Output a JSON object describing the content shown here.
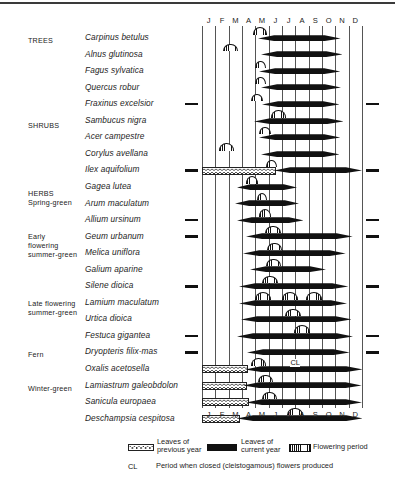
{
  "figure": {
    "months": [
      "J",
      "F",
      "M",
      "A",
      "M",
      "J",
      "J",
      "A",
      "S",
      "O",
      "N",
      "D"
    ]
  },
  "groups": [
    {
      "name": "group-trees",
      "lines": [
        "TREES"
      ],
      "top": 36
    },
    {
      "name": "group-shrubs",
      "lines": [
        "SHRUBS"
      ],
      "top": 121
    },
    {
      "name": "group-herbs-spring",
      "lines": [
        "HERBS",
        "Spring-green"
      ],
      "top": 189
    },
    {
      "name": "group-early-flowering",
      "lines": [
        "Early",
        "flowering",
        "summer-green"
      ],
      "top": 232
    },
    {
      "name": "group-late-flowering",
      "lines": [
        "Late flowering",
        "summer-green"
      ],
      "top": 299
    },
    {
      "name": "group-fern",
      "lines": [
        "Fern"
      ],
      "top": 350
    },
    {
      "name": "group-winter-green",
      "lines": [
        "Winter-green"
      ],
      "top": 384
    }
  ],
  "legend": {
    "previous_year": "Leaves of\nprevious year",
    "current_year": "Leaves of\ncurrent year",
    "flowering": "Flowering period",
    "cl_abbr": "CL",
    "cl_text": "Period when closed (cleistogamous) flowers produced"
  },
  "chart_data": {
    "type": "bar",
    "title": "",
    "xlabel": "",
    "ylabel": "",
    "categories": [
      "J",
      "F",
      "M",
      "A",
      "M",
      "J",
      "J",
      "A",
      "S",
      "O",
      "N",
      "D"
    ],
    "xlim": [
      0,
      12
    ],
    "grid": true,
    "legend_position": "bottom",
    "rows": [
      {
        "species": "Carpinus betulus",
        "group": "TREES",
        "leaves_current": [
          4.2,
          10.4
        ],
        "leaves_previous": null,
        "flowering": [
          [
            3.8,
            4.9
          ]
        ],
        "cl": null,
        "ticks": false
      },
      {
        "species": "Alnus glutinosa",
        "group": "TREES",
        "leaves_current": [
          4.4,
          10.5
        ],
        "leaves_previous": null,
        "flowering": [
          [
            1.6,
            2.7
          ]
        ],
        "cl": null,
        "ticks": false
      },
      {
        "species": "Fagus sylvatica",
        "group": "TREES",
        "leaves_current": [
          4.3,
          10.4
        ],
        "leaves_previous": null,
        "flowering": [
          [
            4.0,
            4.8
          ]
        ],
        "cl": null,
        "ticks": false
      },
      {
        "species": "Quercus robur",
        "group": "TREES",
        "leaves_current": [
          4.4,
          10.4
        ],
        "leaves_previous": null,
        "flowering": [
          [
            4.0,
            4.8
          ]
        ],
        "cl": null,
        "ticks": false
      },
      {
        "species": "Fraxinus excelsior",
        "group": "TREES",
        "leaves_current": [
          4.5,
          10.3
        ],
        "leaves_previous": null,
        "flowering": [
          [
            3.7,
            4.6
          ]
        ],
        "cl": null,
        "ticks": true
      },
      {
        "species": "Sambucus nigra",
        "group": "SHRUBS",
        "leaves_current": [
          3.9,
          10.6
        ],
        "leaves_previous": null,
        "flowering": [
          [
            5.2,
            6.3
          ]
        ],
        "cl": null,
        "ticks": false
      },
      {
        "species": "Acer campestre",
        "group": "SHRUBS",
        "leaves_current": [
          4.3,
          10.4
        ],
        "leaves_previous": null,
        "flowering": [
          [
            4.3,
            5.2
          ]
        ],
        "cl": null,
        "ticks": false
      },
      {
        "species": "Corylus avellana",
        "group": "SHRUBS",
        "leaves_current": [
          4.4,
          10.3
        ],
        "leaves_previous": null,
        "flowering": [
          [
            1.3,
            2.4
          ]
        ],
        "cl": null,
        "ticks": false
      },
      {
        "species": "Ilex aquifolium",
        "group": "SHRUBS",
        "leaves_current": [
          5.4,
          12.0
        ],
        "leaves_previous": [
          0.0,
          5.4
        ],
        "flowering": [
          [
            4.8,
            5.6
          ]
        ],
        "cl": null,
        "ticks": true
      },
      {
        "species": "Gagea lutea",
        "group": "HERBS Spring-green",
        "leaves_current": [
          2.6,
          7.1
        ],
        "leaves_previous": null,
        "flowering": [
          [
            3.3,
            4.2
          ]
        ],
        "cl": null,
        "ticks": false
      },
      {
        "species": "Arum maculatum",
        "group": "HERBS Spring-green",
        "leaves_current": [
          2.5,
          7.3
        ],
        "leaves_previous": null,
        "flowering": [
          [
            4.1,
            4.9
          ]
        ],
        "cl": null,
        "ticks": false
      },
      {
        "species": "Allium ursinum",
        "group": "HERBS Spring-green",
        "leaves_current": [
          2.6,
          7.6
        ],
        "leaves_previous": null,
        "flowering": [
          [
            4.3,
            5.2
          ]
        ],
        "cl": null,
        "ticks": true
      },
      {
        "species": "Geum urbanum",
        "group": "Early flowering summer-green",
        "leaves_current": [
          3.3,
          11.3
        ],
        "leaves_previous": null,
        "flowering": [
          [
            4.7,
            5.9
          ]
        ],
        "cl": null,
        "ticks": true
      },
      {
        "species": "Melica uniflora",
        "group": "Early flowering summer-green",
        "leaves_current": [
          3.1,
          10.8
        ],
        "leaves_previous": null,
        "flowering": [
          [
            4.9,
            6.0
          ]
        ],
        "cl": null,
        "ticks": false
      },
      {
        "species": "Galium aparine",
        "group": "Early flowering summer-green",
        "leaves_current": [
          3.6,
          9.3
        ],
        "leaves_previous": null,
        "flowering": [
          [
            4.8,
            5.9
          ]
        ],
        "cl": null,
        "ticks": false
      },
      {
        "species": "Silene dioica",
        "group": "Early flowering summer-green",
        "leaves_current": [
          2.8,
          11.0
        ],
        "leaves_previous": null,
        "flowering": [
          [
            4.5,
            5.7
          ]
        ],
        "cl": null,
        "ticks": true
      },
      {
        "species": "Lamium maculatum",
        "group": "Late flowering summer-green",
        "leaves_current": [
          2.8,
          10.9
        ],
        "leaves_previous": null,
        "flowering": [
          [
            4.0,
            5.2
          ],
          [
            6.0,
            7.2
          ],
          [
            7.8,
            9.0
          ]
        ],
        "cl": null,
        "ticks": false
      },
      {
        "species": "Urtica dioica",
        "group": "Late flowering summer-green",
        "leaves_current": [
          2.9,
          11.2
        ],
        "leaves_previous": null,
        "flowering": [
          [
            6.2,
            7.4
          ]
        ],
        "cl": null,
        "ticks": false
      },
      {
        "species": "Festuca gigantea",
        "group": "Late flowering summer-green",
        "leaves_current": [
          2.6,
          11.3
        ],
        "leaves_previous": null,
        "flowering": [
          [
            6.9,
            8.1
          ]
        ],
        "cl": null,
        "ticks": true
      },
      {
        "species": "Dryopteris filix-mas",
        "group": "Fern",
        "leaves_current": [
          3.4,
          11.1
        ],
        "leaves_previous": null,
        "flowering": [],
        "cl": null,
        "ticks": true
      },
      {
        "species": "Oxalis acetosella",
        "group": "Fern",
        "leaves_current": [
          3.2,
          12.0
        ],
        "leaves_previous": [
          0.0,
          3.3
        ],
        "flowering": [
          [
            3.7,
            4.8
          ]
        ],
        "cl": [
          6.6,
          7.6
        ],
        "ticks": false
      },
      {
        "species": "Lamiastrum galeobdolon",
        "group": "Winter-green",
        "leaves_current": [
          3.1,
          12.0
        ],
        "leaves_previous": [
          0.0,
          3.2
        ],
        "flowering": [
          [
            4.2,
            5.3
          ]
        ],
        "cl": null,
        "ticks": false
      },
      {
        "species": "Sanicula europaea",
        "group": "Winter-green",
        "leaves_current": [
          3.3,
          12.0
        ],
        "leaves_previous": [
          0.0,
          3.4
        ],
        "flowering": [
          [
            4.5,
            5.6
          ]
        ],
        "cl": null,
        "ticks": false
      },
      {
        "species": "Deschampsia cespitosa",
        "group": "Winter-green",
        "leaves_current": [
          2.6,
          12.0
        ],
        "leaves_previous": [
          0.0,
          2.7
        ],
        "flowering": [
          [
            6.4,
            7.6
          ]
        ],
        "cl": null,
        "ticks": false
      }
    ]
  }
}
